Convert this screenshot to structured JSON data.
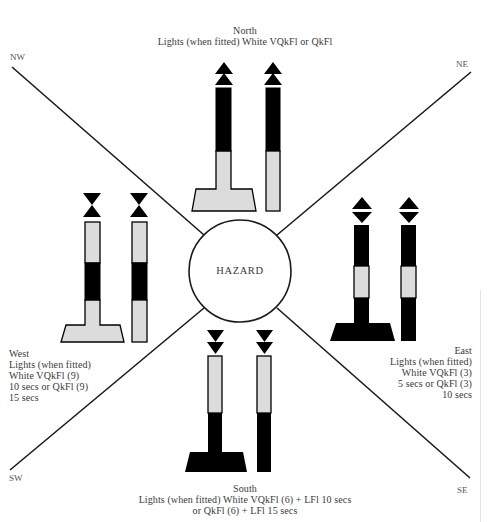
{
  "diagram": {
    "hazard_label": "HAZARD",
    "colors": {
      "black": "#000000",
      "light_gray": "#dcdcdc",
      "line": "#1a1a1a",
      "text": "#3a3a3a"
    },
    "corners": {
      "nw": "NW",
      "ne": "NE",
      "sw": "SW",
      "se": "SE"
    },
    "north": {
      "name": "North",
      "lights_line1": "Lights (when fitted) White VQkFl or QkFl",
      "topmark": "two cones pointing up",
      "colouring": "black above yellow"
    },
    "east": {
      "name": "East",
      "lights_line1": "Lights (when fitted)",
      "lights_line2": "White VQkFl (3)",
      "lights_line3": "5 secs or QkFl (3)",
      "lights_line4": "10 secs",
      "topmark": "two cones base to base",
      "colouring": "black with yellow band"
    },
    "south": {
      "name": "South",
      "lights_line1": "Lights (when fitted) White VQkFl (6) + LFl 10 secs",
      "lights_line2": "or QkFl (6) + LFl 15 secs",
      "topmark": "two cones pointing down",
      "colouring": "yellow above black"
    },
    "west": {
      "name": "West",
      "lights_line1": "Lights (when fitted)",
      "lights_line2": "White VQkFl (9)",
      "lights_line3": "10 secs or QkFl (9)",
      "lights_line4": "15 secs",
      "topmark": "two cones point to point",
      "colouring": "yellow with black band"
    }
  }
}
